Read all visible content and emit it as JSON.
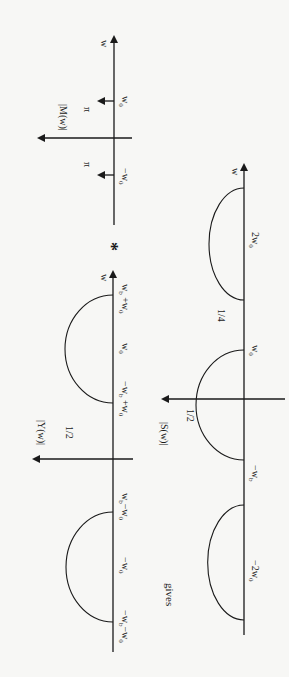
{
  "orientation": "rotated 90 degrees clockwise",
  "operator_symbol": "*",
  "connector_text": "gives",
  "plots": {
    "M": {
      "ylabel": "|M(w)|",
      "xlabel": "w",
      "impulses": [
        {
          "position": "-w_0",
          "label": "−w₀",
          "height_label": "π"
        },
        {
          "position": "w_0",
          "label": "w₀",
          "height_label": "π"
        }
      ]
    },
    "Y": {
      "ylabel": "|Y(w)|",
      "xlabel": "w",
      "peak_label": "1/2",
      "ticks": [
        "−w_b−w₀",
        "−w₀",
        "w_b−w₀",
        "−w_b+w₀",
        "w₀",
        "w_b+w₀"
      ],
      "lobes": [
        {
          "center": "-w_0",
          "from": "-w_b-w_0",
          "to": "w_b-w_0",
          "height": "1/2"
        },
        {
          "center": "w_0",
          "from": "-w_b+w_0",
          "to": "w_b+w_0",
          "height": "1/2"
        }
      ]
    },
    "S": {
      "ylabel": "|S(w)|",
      "xlabel": "w",
      "center_peak_label": "1/2",
      "side_peak_label": "1/4",
      "ticks": [
        "−2w₀",
        "−w_b",
        "w₀",
        "2w₀"
      ],
      "lobes": [
        {
          "center": "-2w_0",
          "height": "1/4"
        },
        {
          "center": "0",
          "from": "-w_b",
          "to": "w_b",
          "height": "1/2"
        },
        {
          "center": "2w_0",
          "height": "1/4"
        }
      ]
    }
  },
  "labels": {
    "M_ylabel": "|M(w)|",
    "Y_ylabel": "|Y(w)|",
    "S_ylabel": "|S(w)|",
    "w": "w",
    "pi": "π",
    "half": "1/2",
    "quarter": "1/4",
    "star": "*",
    "gives": "gives"
  }
}
